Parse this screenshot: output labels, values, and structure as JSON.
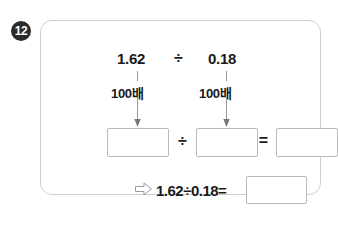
{
  "problem": {
    "number": "12",
    "topic": "decimal-division-by-scaling"
  },
  "expression": {
    "dividend": "1.62",
    "divisor": "0.18",
    "divide_sign": "÷",
    "equals_sign": "="
  },
  "scaling": {
    "dividend_label": "100배",
    "divisor_label": "100배",
    "arrow_icon": "down-arrow-icon"
  },
  "work_row": {
    "dividend_box_value": "",
    "divisor_box_value": "",
    "quotient_box_value": "",
    "divide_sign": "÷",
    "equals_sign": "="
  },
  "conclusion": {
    "arrow_icon": "hollow-right-arrow-icon",
    "equation": "1.62÷0.18=",
    "answer_box_value": ""
  },
  "colors": {
    "badge_fill": "#2b2b2b",
    "badge_text": "#ffffff",
    "card_border": "#cfcfcf",
    "box_border": "#b8b8b8",
    "arrow_stroke": "#9a9a9a",
    "text": "#1a1a1a",
    "page_background": "#ffffff"
  }
}
